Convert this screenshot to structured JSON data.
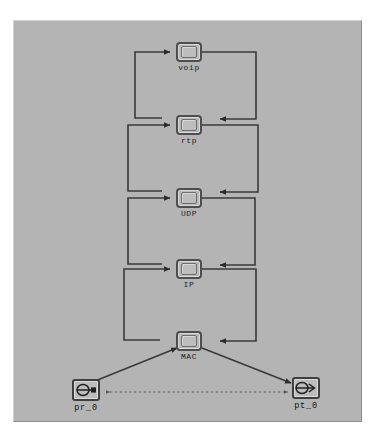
{
  "window": {
    "background_color": "#ffffff",
    "canvas_color": "#b4b4b4"
  },
  "diagram": {
    "type": "node-model",
    "line_color": "#3a3a3a",
    "link_color": "#2b2b2b",
    "nodes": [
      {
        "id": "voip",
        "label": "voip",
        "kind": "process",
        "x": 175,
        "y": 25
      },
      {
        "id": "rtp",
        "label": "rtp",
        "kind": "process",
        "x": 175,
        "y": 95
      },
      {
        "id": "udp",
        "label": "UDP",
        "kind": "process",
        "x": 175,
        "y": 168
      },
      {
        "id": "ip",
        "label": "IP",
        "kind": "process",
        "x": 175,
        "y": 239
      },
      {
        "id": "mac",
        "label": "MAC",
        "kind": "process",
        "x": 175,
        "y": 315
      },
      {
        "id": "pr_0",
        "label": "pr_0",
        "kind": "receiver",
        "x": 72,
        "y": 378
      },
      {
        "id": "pt_0",
        "label": "pt_0",
        "kind": "transmitter",
        "x": 292,
        "y": 376
      }
    ],
    "links": [
      {
        "from": "rtp",
        "to": "voip",
        "style": "solid",
        "routing": "left-loop"
      },
      {
        "from": "voip",
        "to": "rtp",
        "style": "solid",
        "routing": "right-loop"
      },
      {
        "from": "udp",
        "to": "rtp",
        "style": "solid",
        "routing": "left-loop"
      },
      {
        "from": "rtp",
        "to": "udp",
        "style": "solid",
        "routing": "right-loop"
      },
      {
        "from": "ip",
        "to": "udp",
        "style": "solid",
        "routing": "left-loop"
      },
      {
        "from": "udp",
        "to": "ip",
        "style": "solid",
        "routing": "right-loop"
      },
      {
        "from": "mac",
        "to": "ip",
        "style": "solid",
        "routing": "left-loop"
      },
      {
        "from": "ip",
        "to": "mac",
        "style": "solid",
        "routing": "right-loop"
      },
      {
        "from": "pr_0",
        "to": "mac",
        "style": "solid",
        "routing": "diagonal"
      },
      {
        "from": "mac",
        "to": "pt_0",
        "style": "solid",
        "routing": "diagonal"
      },
      {
        "from": "pr_0",
        "to": "pt_0",
        "style": "dashed",
        "routing": "horizontal"
      }
    ],
    "icons": {
      "receiver": "radio-receiver-icon",
      "transmitter": "radio-transmitter-icon"
    }
  }
}
